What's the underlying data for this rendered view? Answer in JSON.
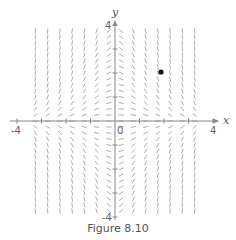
{
  "chart_data": {
    "type": "slope_field",
    "title": "",
    "caption": "Figure 8.10",
    "differential_equation_slope": "-x*y",
    "xlabel": "x",
    "ylabel": "y",
    "xlim": [
      -4,
      4
    ],
    "ylim": [
      -4,
      4
    ],
    "x_tick_labels": [
      "-4",
      "0",
      "4"
    ],
    "y_tick_labels": [
      "4",
      "-4"
    ],
    "x_ticks": [
      -4,
      -3,
      -2,
      -1,
      1,
      2,
      3,
      4
    ],
    "y_ticks": [
      -4,
      -3,
      -2,
      -1,
      1,
      2,
      3,
      4
    ],
    "grid": false,
    "field_columns_x": [
      -3.25,
      -2.75,
      -2.25,
      -1.75,
      -1.25,
      -0.75,
      -0.25,
      0.25,
      0.75,
      1.25,
      1.75,
      2.25,
      2.75,
      3.25
    ],
    "field_row_step": 0.25,
    "field_row_range": [
      -3.75,
      3.75
    ],
    "marked_point": {
      "x": 2,
      "y": 2
    },
    "colors": {
      "axis": "#888888",
      "segment": "#9a9a9a",
      "point": "#111111",
      "text": "#555555"
    }
  },
  "labels": {
    "x_axis": "x",
    "y_axis": "y",
    "x_min": "-4",
    "x_max": "4",
    "origin": "0",
    "y_max": "4",
    "y_min": "-4",
    "caption": "Figure 8.10"
  }
}
